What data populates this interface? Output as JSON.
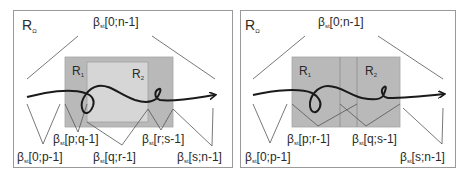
{
  "panels": [
    {
      "region_label": "R",
      "region_sub": "Ω",
      "r1_label": "R",
      "r1_sub": "1",
      "r2_label": "R",
      "r2_sub": "2",
      "beta": "β",
      "beta_sub": "st",
      "labels": {
        "top": "[0;n-1]",
        "a": "[0;p-1]",
        "b": "[p;q-1]",
        "c": "[q;r-1]",
        "d": "[r;s-1]",
        "e": "[s;n-1]"
      }
    },
    {
      "region_label": "R",
      "region_sub": "Ω",
      "r1_label": "R",
      "r1_sub": "1",
      "r2_label": "R",
      "r2_sub": "2",
      "beta": "β",
      "beta_sub": "st",
      "labels": {
        "top": "[0;n-1]",
        "a": "[0;p-1]",
        "b": "[p;r-1]",
        "c": "[q;s-1]",
        "e": "[s;n-1]"
      }
    }
  ],
  "colors": {
    "outer_gray": "#b9b9b9",
    "inner_light": "#d6d6d6",
    "line": "#555555",
    "curve": "#1a1a1a",
    "border": "#9a9a9a"
  }
}
